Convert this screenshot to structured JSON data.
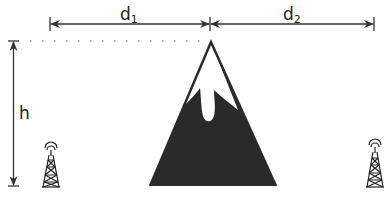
{
  "diagram": {
    "labels": {
      "d1": {
        "base": "d",
        "sub": "1"
      },
      "d2": {
        "base": "d",
        "sub": "2"
      },
      "h": "h"
    },
    "elements": {
      "left_tower": "transmitter-tower-icon",
      "right_tower": "receiver-tower-icon",
      "mountain": "mountain-obstacle"
    },
    "colors": {
      "line": "#333333",
      "mountain_fill": "#2a2a2a",
      "snow": "#ffffff"
    }
  }
}
